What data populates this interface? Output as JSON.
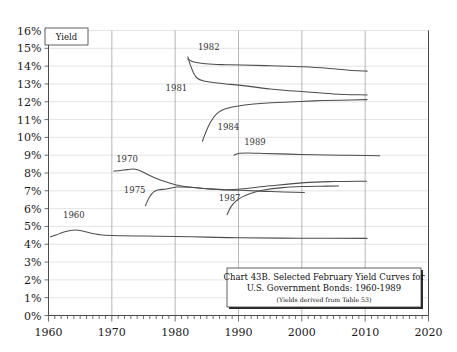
{
  "chart_data": {
    "type": "line",
    "title": "Chart 43B. Selected February Yield Curves for U.S. Government Bonds: 1960-1989",
    "caption_line1": "Chart 43B. Selected February Yield Curves for",
    "caption_line2": "U.S. Government Bonds: 1960-1989",
    "caption_line3": "(Yields derived from Table 53)",
    "xlabel": "",
    "ylabel": "Yield",
    "ylabel_box": "Yield",
    "xlim": [
      1960,
      2020
    ],
    "ylim": [
      0,
      16
    ],
    "grid": "horizontal gridlines every 1%, vertical gridlines every 10 years",
    "legend": "inline curve labels",
    "x_ticks": [
      "1960",
      "1970",
      "1980",
      "1990",
      "2000",
      "2010",
      "2020"
    ],
    "x_tick_values": [
      1960,
      1970,
      1980,
      1990,
      2000,
      2010,
      2020
    ],
    "x_minor_tick_interval": 1,
    "y_ticks": [
      "0%",
      "1%",
      "2%",
      "3%",
      "4%",
      "5%",
      "6%",
      "7%",
      "8%",
      "9%",
      "10%",
      "11%",
      "12%",
      "13%",
      "14%",
      "15%",
      "16%"
    ],
    "y_tick_values": [
      0,
      1,
      2,
      3,
      4,
      5,
      6,
      7,
      8,
      9,
      10,
      11,
      12,
      13,
      14,
      15,
      16
    ],
    "series": [
      {
        "name": "1960",
        "label": "1960",
        "label_x": 1964.0,
        "label_y": 5.45,
        "points": [
          [
            1960.3,
            4.42
          ],
          [
            1961.2,
            4.52
          ],
          [
            1962.2,
            4.66
          ],
          [
            1963.3,
            4.76
          ],
          [
            1964.2,
            4.8
          ],
          [
            1965.4,
            4.74
          ],
          [
            1966.6,
            4.63
          ],
          [
            1968.0,
            4.54
          ],
          [
            1970.0,
            4.49
          ],
          [
            1975.0,
            4.46
          ],
          [
            1980.0,
            4.44
          ],
          [
            1985.0,
            4.4
          ],
          [
            1990.0,
            4.36
          ],
          [
            2000.0,
            4.34
          ],
          [
            2010.3,
            4.33
          ]
        ]
      },
      {
        "name": "1970",
        "label": "1970",
        "label_x": 1972.4,
        "label_y": 8.62,
        "points": [
          [
            1970.3,
            8.1
          ],
          [
            1971.4,
            8.14
          ],
          [
            1972.4,
            8.19
          ],
          [
            1973.4,
            8.22
          ],
          [
            1974.4,
            8.14
          ],
          [
            1976.0,
            7.86
          ],
          [
            1978.0,
            7.56
          ],
          [
            1980.2,
            7.33
          ],
          [
            1982.5,
            7.2
          ],
          [
            1985.0,
            7.12
          ],
          [
            1988.0,
            7.05
          ],
          [
            1990.4,
            7.03
          ],
          [
            1995.0,
            6.96
          ],
          [
            2000.4,
            6.9
          ]
        ]
      },
      {
        "name": "1975",
        "label": "1975",
        "label_x": 1973.6,
        "label_y": 6.88,
        "points": [
          [
            1975.3,
            6.16
          ],
          [
            1975.9,
            6.62
          ],
          [
            1976.6,
            6.94
          ],
          [
            1977.4,
            7.06
          ],
          [
            1978.6,
            7.1
          ],
          [
            1980.2,
            7.21
          ],
          [
            1982.4,
            7.2
          ],
          [
            1985.0,
            7.12
          ],
          [
            1988.0,
            7.06
          ],
          [
            1990.4,
            7.1
          ],
          [
            1995.0,
            7.28
          ],
          [
            2000.4,
            7.46
          ],
          [
            2005.0,
            7.52
          ],
          [
            2010.2,
            7.54
          ]
        ]
      },
      {
        "name": "1981",
        "label": "1981",
        "label_x": 1980.2,
        "label_y": 12.62,
        "points": [
          [
            1982.0,
            14.52
          ],
          [
            1982.4,
            14.06
          ],
          [
            1982.9,
            13.62
          ],
          [
            1983.5,
            13.32
          ],
          [
            1984.4,
            13.18
          ],
          [
            1986.0,
            13.08
          ],
          [
            1988.0,
            13.0
          ],
          [
            1990.4,
            12.92
          ],
          [
            1995.0,
            12.72
          ],
          [
            2000.4,
            12.56
          ],
          [
            2005.0,
            12.44
          ],
          [
            2010.3,
            12.38
          ]
        ]
      },
      {
        "name": "1982",
        "label": "1982",
        "label_x": 1985.3,
        "label_y": 14.92,
        "points": [
          [
            1982.0,
            14.4
          ],
          [
            1982.6,
            14.28
          ],
          [
            1983.4,
            14.2
          ],
          [
            1984.4,
            14.15
          ],
          [
            1986.0,
            14.1
          ],
          [
            1988.0,
            14.08
          ],
          [
            1990.4,
            14.06
          ],
          [
            1995.0,
            14.02
          ],
          [
            2000.4,
            13.96
          ],
          [
            2005.0,
            13.85
          ],
          [
            2008.0,
            13.76
          ],
          [
            2010.3,
            13.72
          ]
        ]
      },
      {
        "name": "1984",
        "label": "1984",
        "label_x": 1988.4,
        "label_y": 10.42,
        "points": [
          [
            1984.3,
            9.78
          ],
          [
            1984.9,
            10.34
          ],
          [
            1985.6,
            10.86
          ],
          [
            1986.5,
            11.3
          ],
          [
            1987.6,
            11.56
          ],
          [
            1989.0,
            11.7
          ],
          [
            1991.0,
            11.82
          ],
          [
            1994.0,
            11.92
          ],
          [
            1998.0,
            11.99
          ],
          [
            2002.0,
            12.05
          ],
          [
            2006.0,
            12.09
          ],
          [
            2010.3,
            12.12
          ]
        ]
      },
      {
        "name": "1989",
        "label": "1989",
        "label_x": 1992.6,
        "label_y": 9.56,
        "points": [
          [
            1989.3,
            9.0
          ],
          [
            1990.0,
            9.1
          ],
          [
            1991.4,
            9.12
          ],
          [
            1994.0,
            9.1
          ],
          [
            1998.0,
            9.06
          ],
          [
            2002.0,
            9.02
          ],
          [
            2006.0,
            9.0
          ],
          [
            2010.0,
            8.98
          ],
          [
            2012.3,
            8.97
          ]
        ]
      },
      {
        "name": "1987",
        "label": "1987",
        "label_x": 1988.6,
        "label_y": 6.44,
        "points": [
          [
            1988.2,
            5.66
          ],
          [
            1988.8,
            6.1
          ],
          [
            1989.6,
            6.42
          ],
          [
            1990.6,
            6.66
          ],
          [
            1992.0,
            6.86
          ],
          [
            1994.0,
            7.04
          ],
          [
            1997.0,
            7.18
          ],
          [
            2000.0,
            7.24
          ],
          [
            2003.0,
            7.26
          ],
          [
            2005.8,
            7.27
          ]
        ]
      }
    ]
  },
  "colors": {
    "background": "#ffffff",
    "curve": "#4d4d4d",
    "grid_h": "#d9d9d9",
    "grid_v": "#9a9a9a",
    "axis": "#4a4a4a",
    "text": "#1a1a1a"
  }
}
